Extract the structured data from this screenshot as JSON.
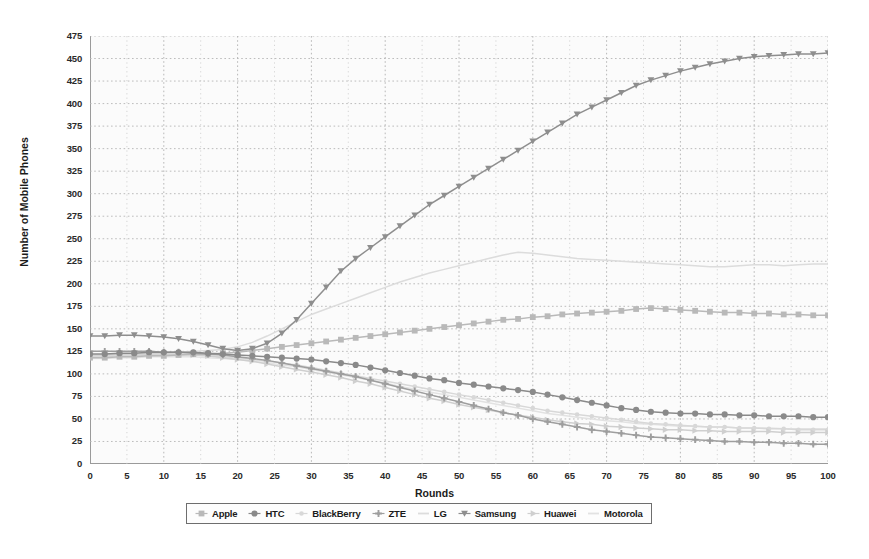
{
  "chart_data": {
    "type": "line",
    "title": "",
    "xlabel": "Rounds",
    "ylabel": "Number of Mobile Phones",
    "xlim": [
      0,
      100
    ],
    "ylim": [
      0,
      475
    ],
    "ytick_step": 25,
    "xtick_step": 5,
    "grid": true,
    "grid_style": "dotted",
    "legend_position": "bottom-center-boxed",
    "xticks": [
      0,
      5,
      10,
      15,
      20,
      25,
      30,
      35,
      40,
      45,
      50,
      55,
      60,
      65,
      70,
      75,
      80,
      85,
      90,
      95,
      100
    ],
    "yticks": [
      0,
      25,
      50,
      75,
      100,
      125,
      150,
      175,
      200,
      225,
      250,
      275,
      300,
      325,
      350,
      375,
      400,
      425,
      450,
      475
    ],
    "x": [
      0,
      2,
      4,
      6,
      8,
      10,
      12,
      14,
      16,
      18,
      20,
      22,
      24,
      26,
      28,
      30,
      32,
      34,
      36,
      38,
      40,
      42,
      44,
      46,
      48,
      50,
      52,
      54,
      56,
      58,
      60,
      62,
      64,
      66,
      68,
      70,
      72,
      74,
      76,
      78,
      80,
      82,
      84,
      86,
      88,
      90,
      92,
      94,
      96,
      98,
      100
    ],
    "series": [
      {
        "name": "Apple",
        "marker": "square",
        "color": "#b9b9b9",
        "values": [
          118,
          118,
          119,
          119,
          120,
          120,
          121,
          122,
          122,
          123,
          124,
          126,
          128,
          130,
          132,
          134,
          136,
          138,
          140,
          142,
          144,
          146,
          148,
          150,
          152,
          154,
          156,
          158,
          160,
          161,
          163,
          164,
          166,
          167,
          168,
          169,
          170,
          172,
          173,
          172,
          171,
          170,
          169,
          168,
          168,
          167,
          167,
          166,
          166,
          165,
          165
        ]
      },
      {
        "name": "HTC",
        "marker": "circle",
        "color": "#8a8a8a",
        "values": [
          122,
          122,
          123,
          123,
          124,
          124,
          124,
          124,
          123,
          122,
          121,
          120,
          119,
          118,
          117,
          116,
          114,
          112,
          110,
          107,
          104,
          101,
          98,
          95,
          93,
          90,
          88,
          86,
          84,
          82,
          80,
          77,
          74,
          71,
          68,
          65,
          62,
          60,
          58,
          57,
          56,
          56,
          55,
          55,
          54,
          54,
          53,
          53,
          53,
          52,
          52
        ]
      },
      {
        "name": "BlackBerry",
        "marker": "dot",
        "color": "#d8d8d8",
        "values": [
          119,
          119,
          120,
          120,
          120,
          121,
          121,
          121,
          120,
          119,
          118,
          116,
          114,
          112,
          110,
          107,
          104,
          101,
          98,
          95,
          92,
          89,
          86,
          83,
          80,
          77,
          74,
          71,
          68,
          65,
          62,
          59,
          57,
          55,
          53,
          51,
          49,
          47,
          45,
          44,
          43,
          42,
          41,
          41,
          40,
          40,
          39,
          39,
          38,
          38,
          38
        ]
      },
      {
        "name": "ZTE",
        "marker": "plus",
        "color": "#9e9e9e",
        "values": [
          125,
          125,
          125,
          125,
          125,
          124,
          124,
          123,
          122,
          121,
          119,
          117,
          115,
          112,
          109,
          106,
          103,
          100,
          97,
          93,
          89,
          85,
          81,
          77,
          73,
          69,
          65,
          61,
          57,
          54,
          50,
          47,
          44,
          41,
          38,
          36,
          34,
          32,
          30,
          29,
          28,
          27,
          26,
          25,
          25,
          24,
          24,
          23,
          23,
          22,
          22
        ]
      },
      {
        "name": "LG",
        "marker": "line",
        "color": "#dcdcdc",
        "values": [
          120,
          120,
          121,
          121,
          122,
          123,
          124,
          125,
          126,
          127,
          130,
          135,
          142,
          150,
          158,
          166,
          172,
          178,
          184,
          190,
          196,
          202,
          207,
          212,
          216,
          220,
          224,
          228,
          232,
          235,
          234,
          232,
          230,
          228,
          227,
          226,
          225,
          224,
          223,
          222,
          221,
          220,
          219,
          219,
          220,
          221,
          221,
          220,
          221,
          222,
          222
        ]
      },
      {
        "name": "Samsung",
        "marker": "triangle-down",
        "color": "#8e8e8e",
        "values": [
          142,
          142,
          143,
          143,
          142,
          141,
          139,
          136,
          132,
          128,
          126,
          128,
          134,
          145,
          160,
          178,
          196,
          214,
          228,
          240,
          252,
          264,
          276,
          288,
          298,
          308,
          318,
          328,
          338,
          348,
          358,
          368,
          378,
          388,
          396,
          404,
          412,
          420,
          426,
          431,
          436,
          440,
          444,
          447,
          450,
          452,
          453,
          454,
          455,
          455,
          456
        ]
      },
      {
        "name": "Huawei",
        "marker": "triangle-right",
        "color": "#cfcfcf",
        "values": [
          121,
          121,
          122,
          122,
          122,
          122,
          122,
          121,
          120,
          118,
          116,
          114,
          111,
          108,
          105,
          102,
          99,
          96,
          92,
          89,
          85,
          81,
          77,
          73,
          70,
          66,
          63,
          60,
          57,
          54,
          52,
          49,
          47,
          45,
          44,
          42,
          41,
          40,
          39,
          38,
          38,
          37,
          37,
          36,
          36,
          36,
          36,
          35,
          35,
          35,
          35
        ]
      },
      {
        "name": "Motorola",
        "marker": "line",
        "color": "#e2e2e2",
        "values": [
          117,
          117,
          118,
          118,
          119,
          119,
          119,
          119,
          118,
          117,
          116,
          114,
          112,
          110,
          108,
          105,
          102,
          99,
          96,
          93,
          90,
          86,
          83,
          80,
          77,
          74,
          71,
          68,
          65,
          62,
          59,
          56,
          54,
          52,
          50,
          48,
          47,
          45,
          44,
          43,
          42,
          42,
          41,
          41,
          40,
          40,
          40,
          39,
          39,
          39,
          39
        ]
      }
    ]
  },
  "axes": {
    "xlabel": "Rounds",
    "ylabel": "Number of Mobile Phones"
  },
  "legend": {
    "items": [
      {
        "label": "Apple"
      },
      {
        "label": "HTC"
      },
      {
        "label": "BlackBerry"
      },
      {
        "label": "ZTE"
      },
      {
        "label": "LG"
      },
      {
        "label": "Samsung"
      },
      {
        "label": "Huawei"
      },
      {
        "label": "Motorola"
      }
    ]
  }
}
